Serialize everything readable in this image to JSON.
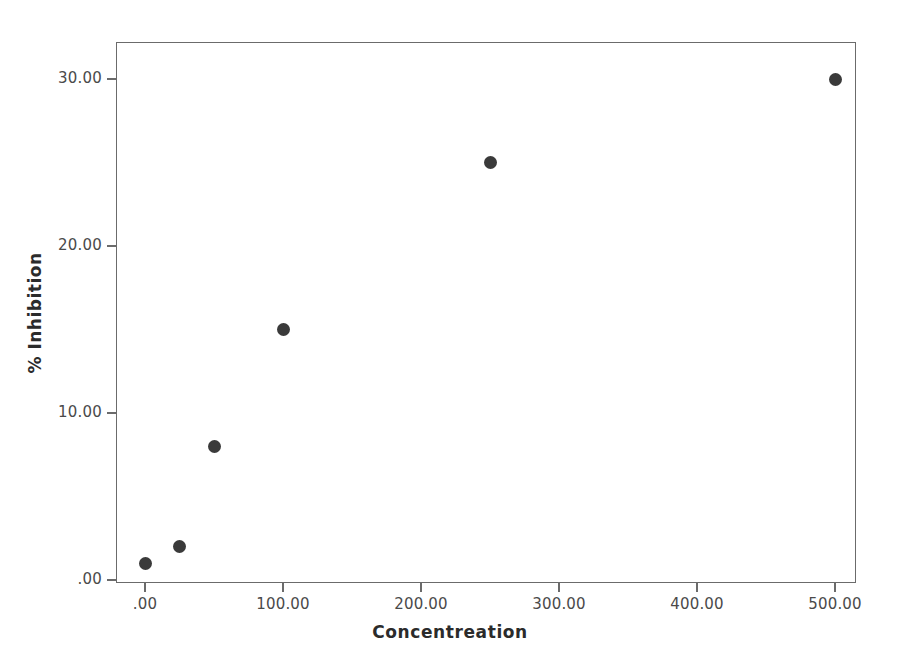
{
  "chart_data": {
    "type": "scatter",
    "title": "",
    "xlabel": "Concentreation",
    "ylabel": "% Inhibition",
    "xlim": [
      -25,
      540
    ],
    "ylim": [
      -1.5,
      32
    ],
    "grid": false,
    "legend": null,
    "marker_color": "#3a3a3a",
    "frame_color": "#6b6b6b",
    "x": [
      0,
      25,
      50,
      100,
      250,
      500
    ],
    "y": [
      1,
      2,
      8,
      15,
      25,
      30
    ],
    "points": [
      {
        "x": 0,
        "y": 1
      },
      {
        "x": 25,
        "y": 2
      },
      {
        "x": 50,
        "y": 8
      },
      {
        "x": 100,
        "y": 15
      },
      {
        "x": 250,
        "y": 25
      },
      {
        "x": 500,
        "y": 30
      }
    ],
    "xticks": [
      {
        "value": 0,
        "label": ".00"
      },
      {
        "value": 100,
        "label": "100.00"
      },
      {
        "value": 200,
        "label": "200.00"
      },
      {
        "value": 300,
        "label": "300.00"
      },
      {
        "value": 400,
        "label": "400.00"
      },
      {
        "value": 500,
        "label": "500.00"
      }
    ],
    "yticks": [
      {
        "value": 0,
        "label": ".00"
      },
      {
        "value": 10,
        "label": "10.00"
      },
      {
        "value": 20,
        "label": "20.00"
      },
      {
        "value": 30,
        "label": "30.00"
      }
    ]
  }
}
